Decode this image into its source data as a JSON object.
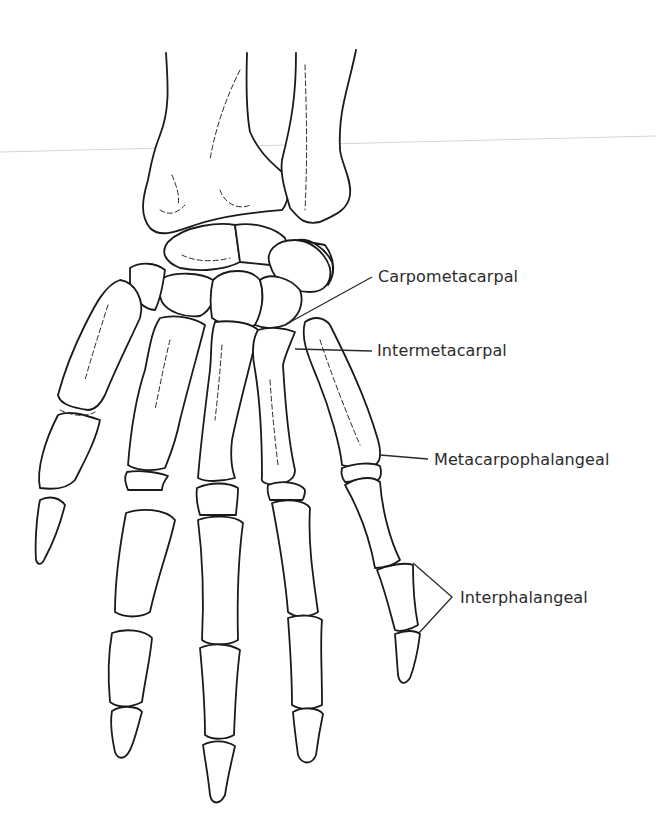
{
  "diagram": {
    "labels": [
      {
        "id": "carpometacarpal",
        "text": "Carpometacarpal"
      },
      {
        "id": "intermetacarpal",
        "text": "Intermetacarpal"
      },
      {
        "id": "metacarpophalangeal",
        "text": "Metacarpophalangeal"
      },
      {
        "id": "interphalangeal",
        "text": "Interphalangeal"
      }
    ],
    "colors": {
      "line": "#1a1a1a",
      "text": "#2b2b2b",
      "background": "#ffffff"
    }
  }
}
